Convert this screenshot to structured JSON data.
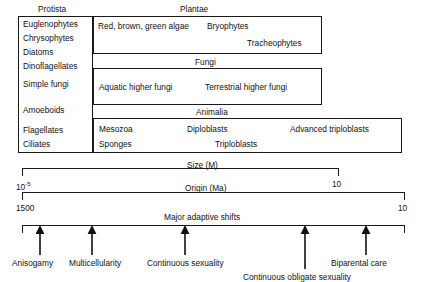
{
  "figure": {
    "kingdom_headers": [
      {
        "id": "protista",
        "label": "Protista"
      },
      {
        "id": "plantae",
        "label": "Plantae"
      },
      {
        "id": "fungi",
        "label": "Fungi"
      },
      {
        "id": "animalia",
        "label": "Animalia"
      }
    ],
    "protista_taxa": [
      "Euglenophytes",
      "Chrysophytes",
      "Diatoms",
      "Dinoflagellates",
      "Simple fungi",
      "Amoeboids",
      "Flagellates",
      "Ciliates"
    ],
    "plantae_taxa": [
      "Red, brown, green algae",
      "Bryophytes",
      "Tracheophytes"
    ],
    "fungi_taxa": [
      "Aquatic higher fungi",
      "Terrestrial higher fungi"
    ],
    "animalia_taxa": [
      "Mesozoa",
      "Diploblasts",
      "Advanced triploblasts",
      "Sponges",
      "Triploblasts"
    ],
    "scales": [
      {
        "id": "size",
        "title": "Size (M)",
        "left_tick": "10",
        "left_tick_exponent": "-5",
        "right_tick": "10"
      },
      {
        "id": "origin",
        "title": "Origin (Ma)",
        "left_tick": "1500",
        "right_tick": "10"
      },
      {
        "id": "shifts",
        "title": "Major adaptive shifts"
      }
    ],
    "adaptive_shifts": [
      "Anisogamy",
      "Multicellularity",
      "Continuous sexuality",
      "Continuous obligate sexuality",
      "Biparental care"
    ],
    "colors": {
      "ink": "#111111",
      "rule": "#1a1a1a",
      "background": "#ffffff"
    }
  }
}
